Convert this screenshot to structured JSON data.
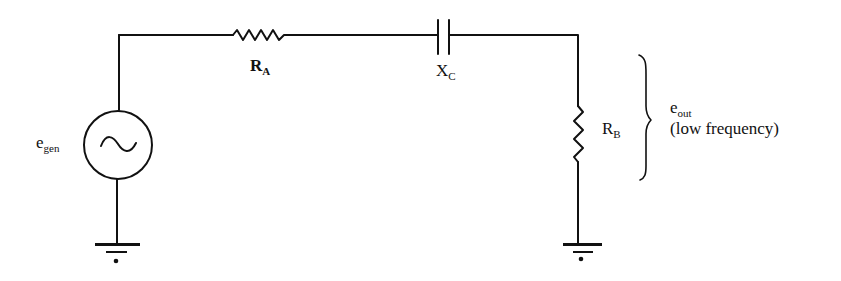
{
  "diagram": {
    "type": "circuit",
    "components": [
      {
        "id": "egen",
        "kind": "ac-voltage-source",
        "label_main": "e",
        "label_sub": "gen"
      },
      {
        "id": "RA",
        "kind": "resistor",
        "label_main": "R",
        "label_sub": "A"
      },
      {
        "id": "XC",
        "kind": "capacitor",
        "label_main": "X",
        "label_sub": "C"
      },
      {
        "id": "RB",
        "kind": "resistor",
        "label_main": "R",
        "label_sub": "B"
      },
      {
        "id": "gnd1",
        "kind": "ground"
      },
      {
        "id": "gnd2",
        "kind": "ground"
      }
    ],
    "output": {
      "label_main": "e",
      "label_sub": "out",
      "note": "(low frequency)"
    },
    "colors": {
      "stroke": "#111111",
      "background": "#ffffff"
    }
  }
}
